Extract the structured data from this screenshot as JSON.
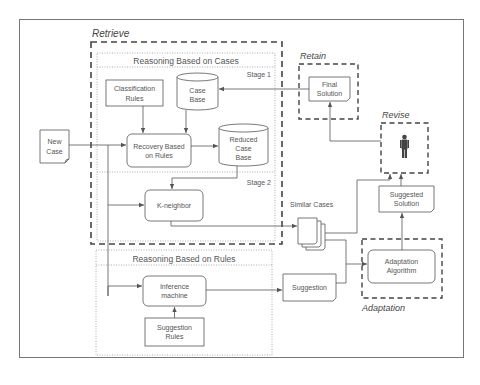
{
  "diagram": {
    "groups": {
      "retrieve": "Retrieve",
      "retain": "Retain",
      "revise": "Revise",
      "adaptation": "Adaptation"
    },
    "sections": {
      "cases_title": "Reasoning Based on Cases",
      "stage1": "Stage 1",
      "stage2": "Stage 2",
      "rules_title": "Reasoning Based on Rules"
    },
    "nodes": {
      "new_case": [
        "New",
        "Case"
      ],
      "classification_rules": [
        "Classification",
        "Rules"
      ],
      "case_base": [
        "Case",
        "Base"
      ],
      "recovery": [
        "Recovery Based",
        "on Rules"
      ],
      "reduced_case_base": [
        "Reduced",
        "Case",
        "Base"
      ],
      "k_neighbor": "K-neighbor",
      "final_solution": [
        "Final",
        "Solution"
      ],
      "suggested_solution": [
        "Suggested",
        "Solution"
      ],
      "adaptation_algorithm": [
        "Adaptation",
        "Algorithm"
      ],
      "similar_cases": "Similar Cases",
      "suggestion": "Suggestion",
      "inference_machine": [
        "Inference",
        "machine"
      ],
      "suggestion_rules": [
        "Suggestion",
        "Rules"
      ]
    },
    "icons": {
      "revise_actor": "person-icon"
    },
    "colors": {
      "line": "#555555",
      "dash": "#444444",
      "dotted": "#999999",
      "text": "#555555"
    }
  }
}
